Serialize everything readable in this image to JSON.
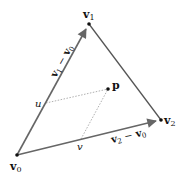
{
  "diagram": {
    "colors": {
      "edge": "#555555",
      "dotted": "#aaaaaa",
      "point": "#111111",
      "text": "#111111"
    },
    "points": {
      "v0": {
        "label": "v",
        "sub": "0",
        "x": 17,
        "y": 155
      },
      "v1": {
        "label": "v",
        "sub": "1",
        "x": 89,
        "y": 24
      },
      "v2": {
        "label": "v",
        "sub": "2",
        "x": 161,
        "y": 120
      },
      "p": {
        "label": "p",
        "x": 108,
        "y": 89
      },
      "u": {
        "label": "u",
        "x": 46,
        "y": 103
      },
      "v": {
        "label": "v",
        "x": 81,
        "y": 139
      }
    },
    "edge_labels": {
      "e1": {
        "a": "v",
        "a_sub": "1",
        "op": " − ",
        "b": "v",
        "b_sub": "0"
      },
      "e2": {
        "a": "v",
        "a_sub": "2",
        "op": " − ",
        "b": "v",
        "b_sub": "0"
      }
    }
  }
}
